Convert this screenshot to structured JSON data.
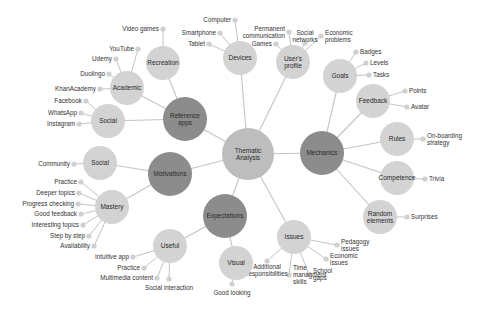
{
  "diagram": {
    "type": "mind-map",
    "colors": {
      "root": "#bdbdbd",
      "theme": "#8c8c8c",
      "subtheme": "#d3d3d3",
      "leaf": "#d0d0d0",
      "edge": "#c4c4c4",
      "text": "#333333"
    },
    "root": {
      "id": "root",
      "label": [
        "Thematic",
        "Analysis"
      ],
      "x": 248,
      "y": 154,
      "r": 26
    },
    "themes": [
      {
        "id": "mechanics",
        "label": [
          "Mechanics"
        ],
        "x": 322,
        "y": 153,
        "r": 22
      },
      {
        "id": "reference-apps",
        "label": [
          "Reference",
          "apps"
        ],
        "x": 185,
        "y": 119,
        "r": 22
      },
      {
        "id": "motivations",
        "label": [
          "Motivations"
        ],
        "x": 170,
        "y": 174,
        "r": 22
      },
      {
        "id": "expectations",
        "label": [
          "Expectations"
        ],
        "x": 225,
        "y": 216,
        "r": 22
      }
    ],
    "subthemes": [
      {
        "id": "devices",
        "parent": "root",
        "label": [
          "Devices"
        ],
        "x": 240,
        "y": 58,
        "r": 17,
        "leaves": [
          {
            "label": [
              "Computer"
            ],
            "x": 231,
            "y": 20,
            "anchor": "end"
          },
          {
            "label": [
              "Smartphone"
            ],
            "x": 216,
            "y": 33,
            "anchor": "end"
          },
          {
            "label": [
              "Tablet"
            ],
            "x": 205,
            "y": 44,
            "anchor": "end"
          }
        ]
      },
      {
        "id": "users-profile",
        "parent": "root",
        "label": [
          "User's",
          "profile"
        ],
        "x": 293,
        "y": 62,
        "r": 17,
        "leaves": [
          {
            "label": [
              "Games"
            ],
            "x": 272,
            "y": 44,
            "anchor": "end"
          },
          {
            "label": [
              "Permanent",
              "communication"
            ],
            "x": 285,
            "y": 32,
            "anchor": "end"
          },
          {
            "label": [
              "Social",
              "networks"
            ],
            "x": 305,
            "y": 36,
            "anchor": "middle"
          },
          {
            "label": [
              "Economic",
              "problems"
            ],
            "x": 325,
            "y": 36,
            "anchor": "start"
          }
        ]
      },
      {
        "id": "issues",
        "parent": "root",
        "label": [
          "Issues"
        ],
        "x": 294,
        "y": 237,
        "r": 17,
        "leaves": [
          {
            "label": [
              "Pedagogy",
              "issues"
            ],
            "x": 341,
            "y": 245,
            "anchor": "start"
          },
          {
            "label": [
              "Economic",
              "issues"
            ],
            "x": 330,
            "y": 259,
            "anchor": "start"
          },
          {
            "label": [
              "School",
              "gaps"
            ],
            "x": 313,
            "y": 274,
            "anchor": "start"
          },
          {
            "label": [
              "Time",
              "managment",
              "skills"
            ],
            "x": 293,
            "y": 275,
            "anchor": "start"
          },
          {
            "label": [
              "Additional",
              "responsibilities"
            ],
            "x": 267,
            "y": 270,
            "anchor": "middle"
          }
        ]
      },
      {
        "id": "recreation",
        "parent": "reference-apps",
        "label": [
          "Recreation"
        ],
        "x": 163,
        "y": 63,
        "r": 17,
        "leaves": [
          {
            "label": [
              "Video games"
            ],
            "x": 159,
            "y": 29,
            "anchor": "end"
          }
        ]
      },
      {
        "id": "academic",
        "parent": "reference-apps",
        "label": [
          "Academic"
        ],
        "x": 127,
        "y": 88,
        "r": 17,
        "leaves": [
          {
            "label": [
              "YouTube"
            ],
            "x": 134,
            "y": 49,
            "anchor": "end"
          },
          {
            "label": [
              "Udemy"
            ],
            "x": 112,
            "y": 59,
            "anchor": "end"
          },
          {
            "label": [
              "Duolingo"
            ],
            "x": 105,
            "y": 74,
            "anchor": "end"
          },
          {
            "label": [
              "KhanAcademy"
            ],
            "x": 96,
            "y": 89,
            "anchor": "end"
          }
        ]
      },
      {
        "id": "social-apps",
        "parent": "reference-apps",
        "label": [
          "Social"
        ],
        "x": 108,
        "y": 121,
        "r": 17,
        "leaves": [
          {
            "label": [
              "Facebook"
            ],
            "x": 82,
            "y": 101,
            "anchor": "end"
          },
          {
            "label": [
              "WhatsApp"
            ],
            "x": 77,
            "y": 113,
            "anchor": "end"
          },
          {
            "label": [
              "Instagram"
            ],
            "x": 75,
            "y": 124,
            "anchor": "end"
          }
        ]
      },
      {
        "id": "social-motivation",
        "parent": "motivations",
        "label": [
          "Social"
        ],
        "x": 100,
        "y": 163,
        "r": 17,
        "leaves": [
          {
            "label": [
              "Community"
            ],
            "x": 70,
            "y": 164,
            "anchor": "end"
          }
        ]
      },
      {
        "id": "mastery",
        "parent": "motivations",
        "label": [
          "Mastery"
        ],
        "x": 112,
        "y": 207,
        "r": 17,
        "leaves": [
          {
            "label": [
              "Practice"
            ],
            "x": 77,
            "y": 182,
            "anchor": "end"
          },
          {
            "label": [
              "Deeper topics"
            ],
            "x": 75,
            "y": 193,
            "anchor": "end"
          },
          {
            "label": [
              "Progress checking"
            ],
            "x": 74,
            "y": 204,
            "anchor": "end"
          },
          {
            "label": [
              "Good feedback"
            ],
            "x": 77,
            "y": 214,
            "anchor": "end"
          },
          {
            "label": [
              "Interesting topics"
            ],
            "x": 79,
            "y": 225,
            "anchor": "end"
          },
          {
            "label": [
              "Step by step"
            ],
            "x": 85,
            "y": 236,
            "anchor": "end"
          },
          {
            "label": [
              "Availability"
            ],
            "x": 90,
            "y": 246,
            "anchor": "end"
          }
        ]
      },
      {
        "id": "useful",
        "parent": "expectations",
        "label": [
          "Useful"
        ],
        "x": 170,
        "y": 246,
        "r": 17,
        "leaves": [
          {
            "label": [
              "Intuitive app"
            ],
            "x": 129,
            "y": 257,
            "anchor": "end"
          },
          {
            "label": [
              "Practice"
            ],
            "x": 140,
            "y": 268,
            "anchor": "end"
          },
          {
            "label": [
              "Multimedia content"
            ],
            "x": 153,
            "y": 278,
            "anchor": "end"
          },
          {
            "label": [
              "Social interaction"
            ],
            "x": 169,
            "y": 288,
            "anchor": "middle"
          }
        ]
      },
      {
        "id": "visual",
        "parent": "expectations",
        "label": [
          "Visual"
        ],
        "x": 236,
        "y": 263,
        "r": 17,
        "leaves": [
          {
            "label": [
              "Good looking"
            ],
            "x": 232,
            "y": 293,
            "anchor": "middle"
          }
        ]
      },
      {
        "id": "goals",
        "parent": "mechanics",
        "label": [
          "Goals"
        ],
        "x": 340,
        "y": 76,
        "r": 17,
        "leaves": [
          {
            "label": [
              "Badges"
            ],
            "x": 360,
            "y": 52,
            "anchor": "start"
          },
          {
            "label": [
              "Levels"
            ],
            "x": 370,
            "y": 63,
            "anchor": "start"
          },
          {
            "label": [
              "Tasks"
            ],
            "x": 373,
            "y": 75,
            "anchor": "start"
          }
        ]
      },
      {
        "id": "feedback",
        "parent": "mechanics",
        "label": [
          "Feedback"
        ],
        "x": 373,
        "y": 101,
        "r": 17,
        "leaves": [
          {
            "label": [
              "Points"
            ],
            "x": 409,
            "y": 91,
            "anchor": "start"
          },
          {
            "label": [
              "Avatar"
            ],
            "x": 411,
            "y": 107,
            "anchor": "start"
          }
        ]
      },
      {
        "id": "rules",
        "parent": "mechanics",
        "label": [
          "Rules"
        ],
        "x": 397,
        "y": 139,
        "r": 17,
        "leaves": [
          {
            "label": [
              "On-boarding",
              "strategy"
            ],
            "x": 427,
            "y": 139,
            "anchor": "start"
          }
        ]
      },
      {
        "id": "competence",
        "parent": "mechanics",
        "label": [
          "Competence"
        ],
        "x": 397,
        "y": 178,
        "r": 17,
        "leaves": [
          {
            "label": [
              "Trivia"
            ],
            "x": 429,
            "y": 179,
            "anchor": "start"
          }
        ]
      },
      {
        "id": "random-elements",
        "parent": "mechanics",
        "label": [
          "Random",
          "elements"
        ],
        "x": 380,
        "y": 217,
        "r": 17,
        "leaves": [
          {
            "label": [
              "Surprises"
            ],
            "x": 411,
            "y": 217,
            "anchor": "start"
          }
        ]
      }
    ]
  }
}
